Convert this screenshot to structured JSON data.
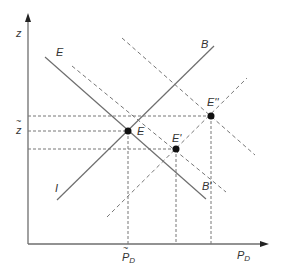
{
  "diagram": {
    "colors": {
      "line": "#6e6e6e",
      "dashed": "#777777",
      "axis": "#6e6e6e",
      "point": "#111111",
      "text": "#333333"
    },
    "axes": {
      "y_label": "z",
      "x_label": "P",
      "x_label_sub": "D"
    },
    "tick_labels": {
      "z_tilde": "z",
      "p_tilde": "P",
      "p_tilde_sub": "D"
    },
    "curve_labels": {
      "E_curve": "E",
      "B_curve": "B",
      "I_curve": "I",
      "B_prime": "B'"
    },
    "points": [
      {
        "id": "E",
        "label": "E"
      },
      {
        "id": "E_prime",
        "label": "E'"
      },
      {
        "id": "E_double_prime",
        "label": "E''"
      }
    ]
  }
}
